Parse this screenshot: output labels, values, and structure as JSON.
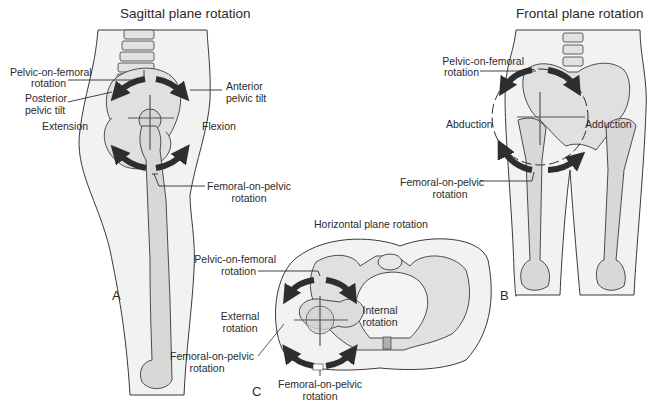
{
  "figure": {
    "colors": {
      "skin_fill": "#f1f1f1",
      "bone_fill": "#dadada",
      "outline": "#3a3a3a",
      "arrow": "#2e2e2e",
      "axis_line": "#555555",
      "text": "#2b2b2b"
    },
    "panels": {
      "A": {
        "letter": "A",
        "title": "Sagittal plane rotation",
        "labels": {
          "pelvic_on_femoral_1": "Pelvic-on-femoral",
          "pelvic_on_femoral_2": "rotation",
          "anterior_tilt_1": "Anterior",
          "anterior_tilt_2": "pelvic tilt",
          "posterior_tilt_1": "Posterior",
          "posterior_tilt_2": "pelvic tilt",
          "extension": "Extension",
          "flexion": "Flexion",
          "femoral_on_pelvic_1": "Femoral-on-pelvic",
          "femoral_on_pelvic_2": "rotation"
        }
      },
      "B": {
        "letter": "B",
        "title": "Frontal plane rotation",
        "labels": {
          "pelvic_on_femoral_1": "Pelvic-on-femoral",
          "pelvic_on_femoral_2": "rotation",
          "abduction": "Abduction",
          "adduction": "Adduction",
          "femoral_on_pelvic_1": "Femoral-on-pelvic",
          "femoral_on_pelvic_2": "rotation"
        }
      },
      "C": {
        "letter": "C",
        "title": "Horizontal plane rotation",
        "labels": {
          "pelvic_on_femoral_1": "Pelvic-on-femoral",
          "pelvic_on_femoral_2": "rotation",
          "external_1": "External",
          "external_2": "rotation",
          "internal_1": "Internal",
          "internal_2": "rotation",
          "femoral_on_pelvic_left_1": "Femoral-on-pelvic",
          "femoral_on_pelvic_left_2": "rotation",
          "femoral_on_pelvic_bottom_1": "Femoral-on-pelvic",
          "femoral_on_pelvic_bottom_2": "rotation"
        }
      }
    }
  }
}
